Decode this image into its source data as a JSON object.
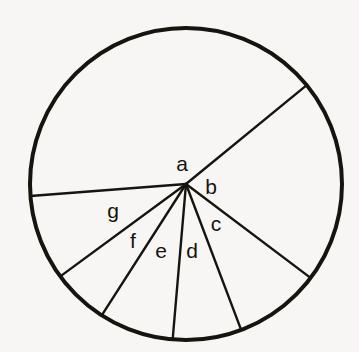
{
  "figure": {
    "name": "circle-divided-into-seven-sectors",
    "kind": "geometry-diagram",
    "background_color": "#f7f6f4",
    "stroke_color": "#16140f",
    "fill_color": "#f7f6f4",
    "circle_outline_width": 4,
    "radius_line_width": 2.4,
    "label_font_size": 21
  },
  "chart_data": {
    "type": "pie",
    "title": "",
    "subtitle": "",
    "xlabel": "",
    "ylabel": "",
    "grid": false,
    "legend": "none",
    "labels_inside": true,
    "center": {
      "x": 186,
      "y": 184
    },
    "radius": 156,
    "total_degrees": 360,
    "categories": [
      "a",
      "b",
      "c",
      "d",
      "e",
      "f",
      "g"
    ],
    "values": [
      145.1,
      76.3,
      32.3,
      25.6,
      27.8,
      21.0,
      31.9
    ],
    "value_unit": "degrees",
    "series": [
      {
        "name": "sector angle (degrees)",
        "values": [
          145.1,
          76.3,
          32.3,
          25.6,
          27.8,
          21.0,
          31.9
        ]
      }
    ],
    "sectors": [
      {
        "label": "a",
        "start_angle": 39.3,
        "end_angle": 184.4,
        "sweep": 145.1,
        "label_x": 182,
        "label_y": 163
      },
      {
        "label": "b",
        "start_angle": -37.0,
        "end_angle": 39.3,
        "sweep": 76.3,
        "label_x": 211,
        "label_y": 186
      },
      {
        "label": "c",
        "start_angle": -69.3,
        "end_angle": -37.0,
        "sweep": 32.3,
        "label_x": 216,
        "label_y": 223
      },
      {
        "label": "d",
        "start_angle": -94.9,
        "end_angle": -69.3,
        "sweep": 25.6,
        "label_x": 192,
        "label_y": 250
      },
      {
        "label": "e",
        "start_angle": -122.7,
        "end_angle": -94.9,
        "sweep": 27.8,
        "label_x": 161,
        "label_y": 250
      },
      {
        "label": "f",
        "start_angle": -143.7,
        "end_angle": -122.7,
        "sweep": 21.0,
        "label_x": 133,
        "label_y": 240
      },
      {
        "label": "g",
        "start_angle": -175.6,
        "end_angle": -143.7,
        "sweep": 31.9,
        "label_x": 113,
        "label_y": 210
      }
    ],
    "radii_endpoints": [
      {
        "for_boundary": "a/b",
        "angle": 39.3,
        "x": 307,
        "y": 85
      },
      {
        "for_boundary": "b/c",
        "angle": -37.0,
        "x": 311,
        "y": 278
      },
      {
        "for_boundary": "c/d",
        "angle": -69.3,
        "x": 241,
        "y": 330
      },
      {
        "for_boundary": "d/e",
        "angle": -94.9,
        "x": 173,
        "y": 339
      },
      {
        "for_boundary": "e/f",
        "angle": -122.7,
        "x": 102,
        "y": 315
      },
      {
        "for_boundary": "f/g",
        "angle": -143.7,
        "x": 60,
        "y": 276
      },
      {
        "for_boundary": "g/a",
        "angle": -175.6,
        "x": 30,
        "y": 196
      }
    ]
  }
}
